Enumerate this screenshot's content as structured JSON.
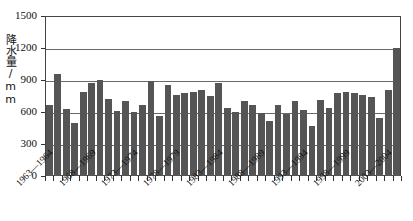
{
  "chart_data": {
    "type": "bar",
    "title": "",
    "xlabel": "",
    "ylabel": "降水量/mm",
    "ylim": [
      0,
      1500
    ],
    "yticks": [
      0,
      300,
      600,
      900,
      1200,
      1500
    ],
    "ytick_labels": [
      "0",
      "300",
      "600",
      "900",
      "1200",
      "1500"
    ],
    "grid": true,
    "grid_axis": "y",
    "legend": "none",
    "bar_color": "#555555",
    "categories": [
      "1963—1964",
      "1964—1965",
      "1965—1966",
      "1966—1967",
      "1967—1968",
      "1968—1969",
      "1969—1970",
      "1970—1971",
      "1971—1972",
      "1972—1973",
      "1973—1974",
      "1974—1975",
      "1975—1976",
      "1976—1977",
      "1977—1978",
      "1978—1979",
      "1979—1980",
      "1980—1981",
      "1981—1982",
      "1982—1983",
      "1983—1984",
      "1984—1985",
      "1985—1986",
      "1986—1987",
      "1987—1988",
      "1988—1989",
      "1989—1990",
      "1990—1991",
      "1991—1992",
      "1992—1993",
      "1993—1994",
      "1994—1995",
      "1995—1996",
      "1996—1997",
      "1997—1998",
      "1998—1999",
      "1999—2000",
      "2000—2001",
      "2001—2002",
      "2002—2003",
      "2003—2004",
      "2004—2005"
    ],
    "tick_labels_shown": [
      "1963—1964",
      "1968—1969",
      "1973—1974",
      "1978—1979",
      "1983—1984",
      "1988—1989",
      "1993—1994",
      "1998—1999",
      "2003—2004"
    ],
    "values": [
      670,
      955,
      630,
      500,
      790,
      870,
      900,
      720,
      610,
      700,
      600,
      670,
      895,
      560,
      855,
      760,
      775,
      790,
      805,
      750,
      870,
      640,
      600,
      700,
      665,
      590,
      520,
      665,
      580,
      700,
      620,
      465,
      710,
      640,
      775,
      790,
      780,
      760,
      740,
      540,
      810,
      1200
    ],
    "units": "mm",
    "series_name": "年降水量"
  },
  "axis": {
    "y_title": "降水量/mm"
  },
  "caption": {
    "partial_text": ""
  }
}
